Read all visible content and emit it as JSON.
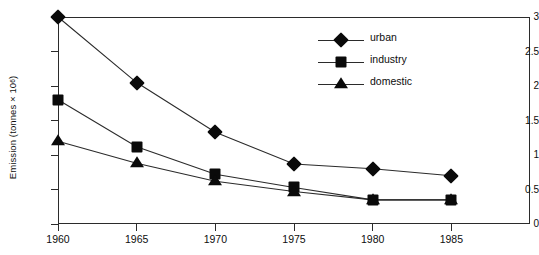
{
  "chart_data": {
    "type": "line",
    "title": "",
    "xlabel": "",
    "ylabel": "Emission (tonnes × 10⁶)",
    "ylabel_base": "Emission (tonnes × 10",
    "ylabel_exp": "6",
    "ylabel_close": ")",
    "categories": [
      "1960",
      "1965",
      "1970",
      "1975",
      "1980",
      "1985"
    ],
    "x": [
      1960,
      1965,
      1970,
      1975,
      1980,
      1985
    ],
    "xlim": [
      1960,
      1990
    ],
    "ylim": [
      0,
      3
    ],
    "yticks": [
      "0",
      "0.5",
      "1",
      "1.5",
      "2",
      "2.5",
      "3"
    ],
    "ytick_values": [
      0,
      0.5,
      1,
      1.5,
      2,
      2.5,
      3
    ],
    "xticks": [
      "1960",
      "1965",
      "1970",
      "1975",
      "1980",
      "1985"
    ],
    "grid": false,
    "legend_position": "upper-center-right",
    "series": [
      {
        "name": "urban",
        "marker": "diamond",
        "values": [
          3.0,
          2.05,
          1.33,
          0.87,
          0.8,
          0.7
        ]
      },
      {
        "name": "industry",
        "marker": "square",
        "values": [
          1.8,
          1.12,
          0.72,
          0.53,
          0.35,
          0.35
        ]
      },
      {
        "name": "domestic",
        "marker": "triangle",
        "values": [
          1.2,
          0.88,
          0.62,
          0.47,
          0.35,
          0.35
        ]
      }
    ]
  },
  "legend": {
    "items": [
      {
        "label": "urban",
        "marker": "diamond-marker"
      },
      {
        "label": "industry",
        "marker": "square-marker"
      },
      {
        "label": "domestic",
        "marker": "triangle-marker"
      }
    ]
  }
}
